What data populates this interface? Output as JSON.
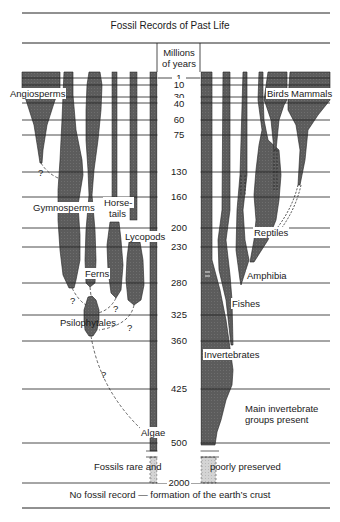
{
  "title": "Fossil Records of Past Life",
  "axis": {
    "header_line1": "Millions",
    "header_line2": "of years",
    "ticks": [
      "1",
      "10",
      "30",
      "40",
      "60",
      "75",
      "130",
      "160",
      "200",
      "230",
      "280",
      "325",
      "360",
      "425",
      "500",
      "2000"
    ]
  },
  "groups": {
    "plants": [
      "Angiosperms",
      "Gymnosperms",
      "Horse-",
      "tails",
      "Lycopods",
      "Ferns",
      "Psilophytales",
      "Algae"
    ],
    "animals": [
      "Birds",
      "Mammals",
      "Reptiles",
      "Amphibia",
      "Fishes",
      "Invertebrates"
    ]
  },
  "labels": {
    "angiosperms": "Angiosperms",
    "gymnosperms": "Gymnosperms",
    "horsetails_1": "Horse-",
    "horsetails_2": "tails",
    "lycopods": "Lycopods",
    "ferns": "Ferns",
    "psilophytales": "Psilophytales",
    "algae": "Algae",
    "birds": "Birds",
    "mammals": "Mammals",
    "reptiles": "Reptiles",
    "amphibia": "Amphibia",
    "fishes": "Fishes",
    "invertebrates": "Invertebrates",
    "main_inv_1": "Main invertebrate",
    "main_inv_2": "groups present",
    "rare_left": "Fossils rare and",
    "rare_right": "poorly preserved",
    "unknown_marker": "?"
  },
  "footer": "No fossil record — formation of the earth’s crust",
  "colors": {
    "fill": "#5a5a5a",
    "line": "#1a1a1a",
    "faint_fill": "#cfcfcf",
    "background": "#ffffff"
  }
}
